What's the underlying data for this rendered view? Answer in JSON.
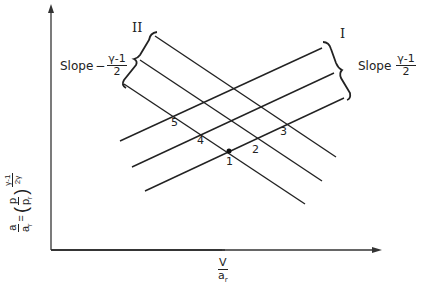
{
  "diagram": {
    "x_axis_label": {
      "num": "V",
      "den": "a_r",
      "den_main": "a",
      "den_sub": "r"
    },
    "y_axis_label": {
      "lhs_num": "a",
      "lhs_den": "a",
      "lhs_den_sub": "r",
      "equals": "=",
      "p_num": "p",
      "p_den": "p",
      "p_den_sub": "r",
      "exp_num": "γ-1",
      "exp_den": "2γ"
    },
    "family_II": {
      "label": "II",
      "slope_text": "Slope",
      "sign": "−",
      "slope_num": "γ-1",
      "slope_den": "2"
    },
    "family_I": {
      "label": "I",
      "slope_text": "Slope",
      "slope_num": "γ-1",
      "slope_den": "2"
    },
    "points": [
      "1",
      "2",
      "3",
      "4",
      "5"
    ],
    "line_color": "#222222",
    "background": "#ffffff"
  }
}
